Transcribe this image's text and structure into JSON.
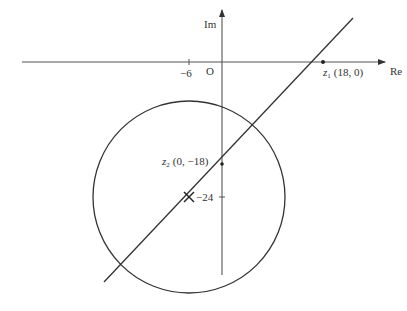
{
  "axes": {
    "real_label": "Re",
    "imag_label": "Im",
    "origin_label": "O",
    "real_tick_label": "−6",
    "imag_tick_label": "−24"
  },
  "points": {
    "z1": {
      "name": "z",
      "subscript": "1",
      "coords": "(18, 0)"
    },
    "z2": {
      "name": "z",
      "subscript": "2",
      "coords": "(0, −18)"
    },
    "center_marker": "×"
  },
  "shapes": {
    "circle": {
      "center": [
        -6,
        -24
      ],
      "radius_units": 17.5
    },
    "line": {
      "through": [
        "z1 (18, 0)",
        "z2 (0, -18)"
      ]
    }
  },
  "colors": {
    "stroke": "#333333",
    "background": "#ffffff"
  }
}
